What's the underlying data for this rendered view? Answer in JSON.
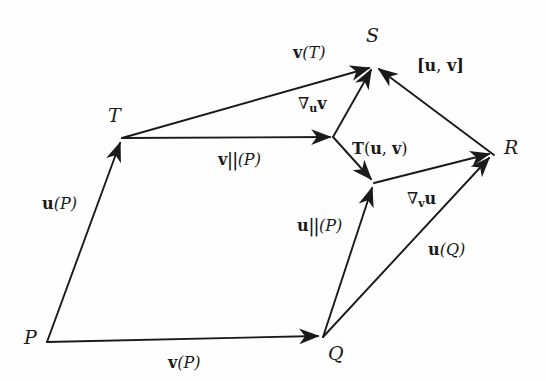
{
  "figure": {
    "kind": "vector-field-commutator-diagram",
    "background_color": "#fefefe",
    "stroke_color": "#1a1a1a"
  },
  "points": [
    {
      "id": "P",
      "label": "P",
      "x": 47,
      "y": 342,
      "label_x": 24,
      "label_y": 330
    },
    {
      "id": "T",
      "label": "T",
      "x": 122,
      "y": 138,
      "label_x": 110,
      "label_y": 110
    },
    {
      "id": "Q",
      "label": "Q",
      "x": 323,
      "y": 337,
      "label_x": 326,
      "label_y": 345
    },
    {
      "id": "S",
      "label": "S",
      "x": 374,
      "y": 65,
      "label_x": 367,
      "label_y": 28
    },
    {
      "id": "R",
      "label": "R",
      "x": 494,
      "y": 155,
      "label_x": 503,
      "label_y": 140
    },
    {
      "id": "J1",
      "label": "",
      "x": 333,
      "y": 137,
      "label_x": 0,
      "label_y": 0
    },
    {
      "id": "J2",
      "label": "",
      "x": 374,
      "y": 183,
      "label_x": 0,
      "label_y": 0
    }
  ],
  "arrows": [
    {
      "id": "u-at-P",
      "from": "P",
      "to": "T",
      "label": "u(P)"
    },
    {
      "id": "v-at-P",
      "from": "P",
      "to": "Q",
      "label": "v(P)"
    },
    {
      "id": "v-at-T",
      "from": "T",
      "to": "S",
      "label": "v(T)"
    },
    {
      "id": "v-par-at-P",
      "from": "T",
      "to": "J1",
      "label": "v||(P)"
    },
    {
      "id": "nabla-u-v",
      "from": "J1",
      "to": "S",
      "label": "∇uv"
    },
    {
      "id": "torsion",
      "from": "J1",
      "to": "J2",
      "label": "T(u, v)"
    },
    {
      "id": "u-par-at-P",
      "from": "Q",
      "to": "J2",
      "label": "u||(P)"
    },
    {
      "id": "nabla-v-u",
      "from": "J2",
      "to": "R",
      "label": "∇vu"
    },
    {
      "id": "u-at-Q",
      "from": "Q",
      "to": "R",
      "label": "u(Q)"
    },
    {
      "id": "commutator",
      "from": "R",
      "to": "S",
      "label": "[u, v]"
    }
  ],
  "labels": {
    "point_P": "P",
    "point_T": "T",
    "point_Q": "Q",
    "point_S": "S",
    "point_R": "R",
    "u_of_P_vec": "u",
    "u_of_P_arg": "(P)",
    "v_of_P_vec": "v",
    "v_of_P_arg": "(P)",
    "v_of_T_vec": "v",
    "v_of_T_arg": "(T)",
    "v_par_vec": "v",
    "v_par_bars": "||",
    "v_par_arg": "(P)",
    "u_par_vec": "u",
    "u_par_bars": "||",
    "u_par_arg": "(P)",
    "u_of_Q_vec": "u",
    "u_of_Q_arg": "(Q)",
    "nabla_u_v_sym": "∇",
    "nabla_u_v_sub": "u",
    "nabla_u_v_main": "v",
    "nabla_v_u_sym": "∇",
    "nabla_v_u_sub": "v",
    "nabla_v_u_main": "u",
    "torsion_T": "T",
    "torsion_open": "(",
    "torsion_u": "u",
    "torsion_comma": ",",
    "torsion_v": "v",
    "torsion_close": ")",
    "commutator_open": "[",
    "commutator_u": "u",
    "commutator_comma": ",",
    "commutator_v": "v",
    "commutator_close": "]"
  }
}
